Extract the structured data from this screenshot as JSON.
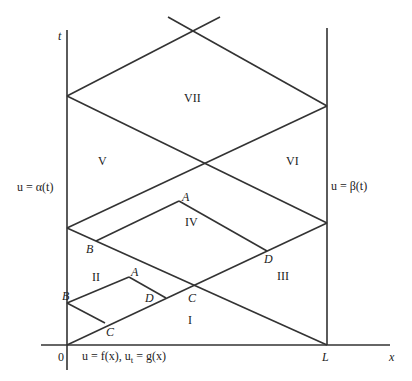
{
  "axes": {
    "t_label": "t",
    "x_label": "x",
    "origin_label": "0",
    "L_label": "L"
  },
  "boundary_conditions": {
    "left": "u = α(t)",
    "right": "u = β(t)",
    "initial": "u = f(x),  u_t = g(x)",
    "initial_html_a": "u = f(x),  u",
    "initial_sub": "t",
    "initial_html_b": " = g(x)"
  },
  "regions": [
    "I",
    "II",
    "III",
    "IV",
    "V",
    "VI",
    "VII"
  ],
  "points": {
    "lower_B": "B",
    "lower_C": "C",
    "lower_A": "A",
    "lower_D": "D",
    "mid_C": "C",
    "upper_B": "B",
    "upper_A": "A",
    "upper_D": "D"
  },
  "colors": {
    "line": "#333333",
    "text": "#222222"
  }
}
